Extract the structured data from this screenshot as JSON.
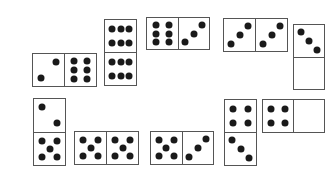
{
  "puzzle": {
    "pip_color": "#1a1a1a",
    "border_color": "#555555",
    "dominoes": [
      {
        "id": "d1",
        "orientation": "h",
        "x": 32,
        "y": 53,
        "w": 65,
        "h": 34,
        "values": [
          2,
          6
        ]
      },
      {
        "id": "d2",
        "orientation": "v",
        "x": 104,
        "y": 19,
        "w": 33,
        "h": 67,
        "values": [
          6,
          6
        ]
      },
      {
        "id": "d3",
        "orientation": "h",
        "x": 146,
        "y": 17,
        "w": 64,
        "h": 33,
        "values": [
          6,
          3
        ]
      },
      {
        "id": "d4",
        "orientation": "h",
        "x": 223,
        "y": 18,
        "w": 65,
        "h": 34,
        "values": [
          3,
          3
        ]
      },
      {
        "id": "d5",
        "orientation": "v",
        "x": 293,
        "y": 24,
        "w": 32,
        "h": 66,
        "values": [
          3,
          0
        ]
      },
      {
        "id": "d6",
        "orientation": "v",
        "x": 33,
        "y": 98,
        "w": 33,
        "h": 68,
        "values": [
          2,
          5
        ]
      },
      {
        "id": "d7",
        "orientation": "h",
        "x": 74,
        "y": 131,
        "w": 65,
        "h": 34,
        "values": [
          5,
          5
        ]
      },
      {
        "id": "d8",
        "orientation": "h",
        "x": 150,
        "y": 131,
        "w": 64,
        "h": 34,
        "values": [
          5,
          3
        ]
      },
      {
        "id": "d9",
        "orientation": "v",
        "x": 224,
        "y": 99,
        "w": 33,
        "h": 67,
        "values": [
          4,
          3
        ]
      },
      {
        "id": "d10",
        "orientation": "h",
        "x": 262,
        "y": 99,
        "w": 63,
        "h": 34,
        "values": [
          4,
          0
        ]
      }
    ]
  }
}
